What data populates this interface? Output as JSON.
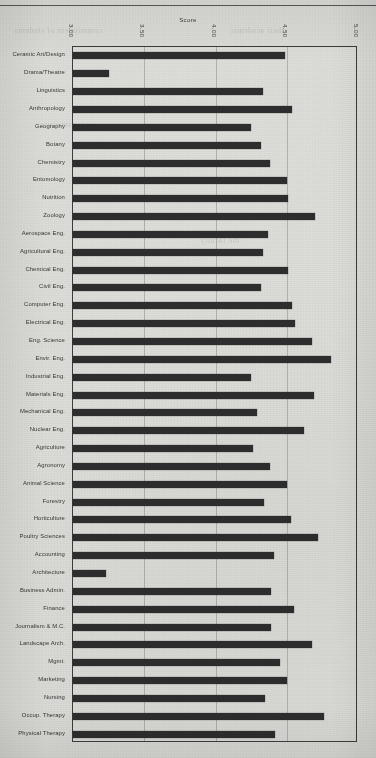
{
  "document": {
    "type": "scanned-page",
    "page_rule": "horizontal-rule-top",
    "paper_color": "#dcdcd8",
    "ink_color": "#2e2e2e"
  },
  "chart_data": {
    "type": "bar",
    "orientation": "horizontal",
    "title": "Score",
    "xlabel": "",
    "ylabel": "",
    "xlim": [
      3.0,
      5.0
    ],
    "grid": true,
    "legend": "none",
    "tick_labels": [
      "3.00",
      "3.50",
      "4.00",
      "4.50",
      "5.00"
    ],
    "tick_values": [
      3.0,
      3.5,
      4.0,
      4.5,
      5.0
    ],
    "categories": [
      "Ceramic Art/Design",
      "Drama/Theatre",
      "Linguistics",
      "Anthropology",
      "Geography",
      "Botany",
      "Chemistry",
      "Entomology",
      "Nutrition",
      "Zoology",
      "Aerospace Eng.",
      "Agricultural Eng.",
      "Chemical Eng.",
      "Civil Eng.",
      "Computer Eng.",
      "Electrical Eng.",
      "Eng. Science",
      "Envir. Eng.",
      "Industrial Eng.",
      "Materials  Eng.",
      "Mechanical Eng.",
      "Nuclear  Eng.",
      "Agriculture",
      "Agronomy",
      "Animal Science",
      "Forestry",
      "Horticulture",
      "Poultry Sciences",
      "Accounting",
      "Architecture",
      "Business Admin.",
      "Finance",
      "Journalism & M.C.",
      "Landscape Arch.",
      "Mgmt.",
      "Marketing",
      "Nursing",
      "Occup. Therapy",
      "Physical Therapy"
    ],
    "values": [
      4.49,
      3.25,
      4.33,
      4.54,
      4.25,
      4.32,
      4.38,
      4.5,
      4.51,
      4.7,
      4.37,
      4.33,
      4.51,
      4.32,
      4.54,
      4.56,
      4.68,
      4.81,
      4.25,
      4.69,
      4.29,
      4.62,
      4.26,
      4.38,
      4.5,
      4.34,
      4.53,
      4.72,
      4.41,
      3.23,
      4.39,
      4.55,
      4.39,
      4.68,
      4.45,
      4.5,
      4.35,
      4.76,
      4.42
    ]
  }
}
